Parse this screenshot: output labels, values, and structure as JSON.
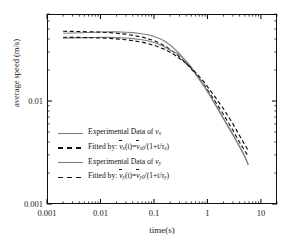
{
  "chart_data": {
    "type": "line",
    "title": "",
    "xlabel": "time(s)",
    "ylabel": "average speed (m/s)",
    "xscale": "log",
    "yscale": "log",
    "xlim": [
      0.001,
      20
    ],
    "ylim": [
      0.001,
      0.07
    ],
    "grid": false,
    "legend_position": "inside-lower-left",
    "x_ticks": [
      "0.001",
      "0.01",
      "0.1",
      "1",
      "10"
    ],
    "x_tick_values": [
      0.001,
      0.01,
      0.1,
      1,
      10
    ],
    "y_ticks": [
      "0.01",
      "0.001"
    ],
    "y_tick_values": [
      0.01,
      0.001
    ],
    "series": [
      {
        "name": "Experimental Data of vx",
        "style": "solid",
        "color": "#808080",
        "x": [
          0.002,
          0.003,
          0.004,
          0.006,
          0.008,
          0.01,
          0.015,
          0.02,
          0.03,
          0.04,
          0.06,
          0.08,
          0.1,
          0.13,
          0.16,
          0.2,
          0.25,
          0.3,
          0.4,
          0.5,
          0.7,
          0.9,
          1.2,
          1.6,
          2.0,
          2.6,
          3.2,
          4.0,
          5.0,
          5.8
        ],
        "y": [
          0.0455,
          0.0458,
          0.046,
          0.0463,
          0.0466,
          0.0468,
          0.047,
          0.047,
          0.0466,
          0.0461,
          0.045,
          0.0438,
          0.0424,
          0.0402,
          0.038,
          0.035,
          0.0316,
          0.0288,
          0.0243,
          0.021,
          0.0163,
          0.0135,
          0.0106,
          0.0082,
          0.0067,
          0.0053,
          0.0044,
          0.0036,
          0.0029,
          0.0024
        ]
      },
      {
        "name": "Fitted by: vx(t)=vx0/(1+t/taux)",
        "style": "dashed",
        "color": "#111111",
        "v0": 0.0478,
        "tau": 0.42,
        "x": [
          0.002,
          0.004,
          0.008,
          0.015,
          0.03,
          0.06,
          0.1,
          0.16,
          0.25,
          0.4,
          0.6,
          0.9,
          1.4,
          2.0,
          3.0,
          4.2,
          5.8
        ],
        "y": [
          0.0476,
          0.0473,
          0.0469,
          0.0461,
          0.0446,
          0.0418,
          0.0387,
          0.0344,
          0.0292,
          0.0232,
          0.0184,
          0.014,
          0.0099,
          0.0074,
          0.0052,
          0.0038,
          0.0029
        ]
      },
      {
        "name": "Experimental Data of vy",
        "style": "solid",
        "color": "#808080",
        "x": [
          0.002,
          0.003,
          0.004,
          0.006,
          0.008,
          0.01,
          0.015,
          0.02,
          0.03,
          0.04,
          0.06,
          0.08,
          0.1,
          0.13,
          0.16,
          0.2,
          0.25,
          0.3,
          0.4,
          0.5,
          0.7,
          0.9,
          1.2,
          1.6,
          2.0,
          2.6,
          3.2,
          4.0,
          5.0,
          5.8
        ],
        "y": [
          0.0408,
          0.041,
          0.0411,
          0.0413,
          0.0414,
          0.0415,
          0.0415,
          0.0413,
          0.0409,
          0.0404,
          0.0394,
          0.0383,
          0.037,
          0.0352,
          0.0334,
          0.0312,
          0.0296,
          0.028,
          0.0244,
          0.0213,
          0.0166,
          0.0137,
          0.0107,
          0.0083,
          0.0068,
          0.0054,
          0.0045,
          0.0036,
          0.0029,
          0.0024
        ]
      },
      {
        "name": "Fitted by: vy(t)=vy0/(1+t/tauy)",
        "style": "dashed",
        "color": "#111111",
        "v0": 0.0418,
        "tau": 0.5,
        "x": [
          0.002,
          0.004,
          0.008,
          0.015,
          0.03,
          0.06,
          0.1,
          0.16,
          0.25,
          0.4,
          0.6,
          0.9,
          1.4,
          2.0,
          3.0,
          4.2,
          5.8
        ],
        "y": [
          0.0416,
          0.0415,
          0.0411,
          0.0406,
          0.0394,
          0.0373,
          0.0348,
          0.0317,
          0.0278,
          0.0232,
          0.019,
          0.0149,
          0.0109,
          0.0084,
          0.006,
          0.0044,
          0.0033
        ]
      }
    ]
  },
  "axes": {
    "xlabel": "time(s)",
    "ylabel": "average speed (m/s)",
    "x_tick_labels": [
      "0.001",
      "0.01",
      "0.1",
      "1",
      "10"
    ],
    "y_tick_labels": [
      "0.01",
      "0.001"
    ]
  },
  "legend": {
    "entries": [
      {
        "key": "solid-gray",
        "prefix": "Experimental Data of ",
        "var": "v",
        "sub": "x",
        "kind": "data"
      },
      {
        "key": "dashed-black",
        "prefix": "Fitted by: ",
        "kind": "fit",
        "lhs_var": "v",
        "lhs_sub": "x",
        "lhs_arg": "(t)=",
        "rhs_var": "v",
        "rhs_sub": "x0",
        "rhs_tail": "/(1+t/",
        "tau": "τ",
        "tau_sub": "x",
        "close": ")"
      },
      {
        "key": "solid-gray",
        "prefix": "Experimental Data of ",
        "var": "v",
        "sub": "y",
        "kind": "data"
      },
      {
        "key": "dashed-black",
        "prefix": "Fitted by: ",
        "kind": "fit",
        "lhs_var": "v",
        "lhs_sub": "y",
        "lhs_arg": "(t)=",
        "rhs_var": "v",
        "rhs_sub": "y0",
        "rhs_tail": "/(1+t/",
        "tau": "τ",
        "tau_sub": "y",
        "close": ")"
      }
    ]
  },
  "colors": {
    "data_line": "#808080",
    "fit_line": "#111111",
    "frame": "#111111",
    "background": "#ffffff"
  }
}
